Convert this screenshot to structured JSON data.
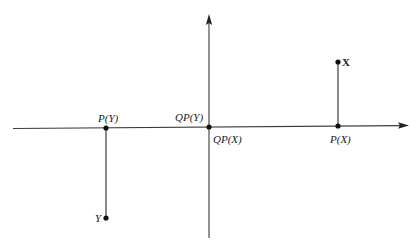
{
  "diagram": {
    "type": "projection-diagram",
    "axes": {
      "horizontal": {
        "from": [
          13,
          128.5
        ],
        "to": [
          407,
          125.5
        ],
        "arrow": "right"
      },
      "vertical": {
        "from": [
          209,
          238
        ],
        "to": [
          209,
          15
        ],
        "arrow": "up"
      }
    },
    "points": [
      {
        "id": "X",
        "label": "X",
        "x": 338,
        "y": 62
      },
      {
        "id": "P_X",
        "label": "P(X)",
        "x": 338,
        "y": 126
      },
      {
        "id": "Y",
        "label": "Y",
        "x": 106,
        "y": 218
      },
      {
        "id": "P_Y",
        "label": "P(Y)",
        "x": 106,
        "y": 128
      },
      {
        "id": "QP",
        "label": "QP(Y) / QP(X)",
        "x": 209,
        "y": 127
      }
    ],
    "labels": {
      "x": "X",
      "y": "Y",
      "p_x": "P(X)",
      "p_y": "P(Y)",
      "qp_y": "QP(Y)",
      "qp_x": "QP(X)"
    },
    "projection_lines": [
      {
        "from": "X",
        "to": "P_X"
      },
      {
        "from": "Y",
        "to": "P_Y"
      }
    ],
    "colors": {
      "ink": "#1a1a1a",
      "axis": "#3a3a3a",
      "background": "#ffffff"
    }
  }
}
